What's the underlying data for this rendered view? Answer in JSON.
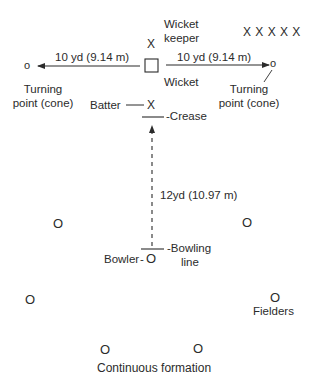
{
  "diagram": {
    "wicket_keeper": {
      "marker": "X",
      "label_line1": "Wicket",
      "label_line2": "keeper"
    },
    "wicket": {
      "label": "Wicket"
    },
    "waiting_players": {
      "markers": "X X X X X"
    },
    "left_run": {
      "distance": "10 yd (9.14 m)",
      "cone_marker": "o",
      "turning_line1": "Turning",
      "turning_line2": "point (cone)"
    },
    "right_run": {
      "distance": "10 yd (9.14 m)",
      "cone_marker": "o",
      "turning_line1": "Turning",
      "turning_line2": "point (cone)"
    },
    "batter": {
      "label": "Batter",
      "marker": "X"
    },
    "crease": {
      "label": "-Crease"
    },
    "bowl_distance": {
      "label": "12yd (10.97 m)"
    },
    "bowler": {
      "label": "Bowler",
      "marker": "O"
    },
    "bowling_line": {
      "label_line1": "-Bowling",
      "label_line2": "line"
    },
    "fielders": {
      "marker": "O",
      "label": "Fielders",
      "positions": [
        {
          "x": 58,
          "y": 223
        },
        {
          "x": 247,
          "y": 222
        },
        {
          "x": 30,
          "y": 299
        },
        {
          "x": 275,
          "y": 297
        },
        {
          "x": 105,
          "y": 348
        },
        {
          "x": 198,
          "y": 347
        }
      ]
    },
    "formation_label": "Continuous formation",
    "colors": {
      "ink": "#2b2b2b",
      "background": "#ffffff"
    }
  }
}
